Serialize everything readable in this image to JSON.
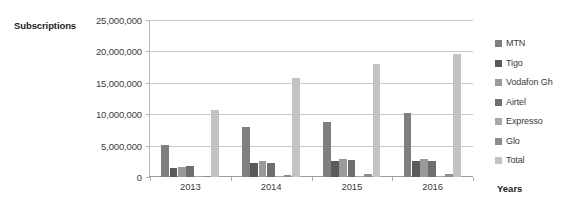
{
  "chart_data": {
    "type": "bar",
    "title": "",
    "xlabel": "Years",
    "ylabel": "Subscriptions",
    "categories": [
      "2013",
      "2014",
      "2015",
      "2016"
    ],
    "ylim": [
      0,
      25000000
    ],
    "yticks": [
      0,
      5000000,
      10000000,
      15000000,
      20000000,
      25000000
    ],
    "ytick_labels": [
      "0",
      "5,000,000",
      "10,000,000",
      "15,000,000",
      "20,000,000",
      "25,000,000"
    ],
    "grid": true,
    "legend_position": "right",
    "series": [
      {
        "name": "MTN",
        "color": "#7f7f7f",
        "values": [
          5100000,
          8000000,
          8700000,
          10200000
        ]
      },
      {
        "name": "Tigo",
        "color": "#5a5a5a",
        "values": [
          1400000,
          2200000,
          2600000,
          2500000
        ]
      },
      {
        "name": "Vodafon Gh",
        "color": "#9a9a9a",
        "values": [
          1600000,
          2500000,
          2900000,
          2900000
        ]
      },
      {
        "name": "Airtel",
        "color": "#6e6e6e",
        "values": [
          1700000,
          2300000,
          2700000,
          2600000
        ]
      },
      {
        "name": "Expresso",
        "color": "#a8a8a8",
        "values": [
          100000,
          120000,
          120000,
          110000
        ]
      },
      {
        "name": "Glo",
        "color": "#8c8c8c",
        "values": [
          150000,
          400000,
          420000,
          420000
        ]
      },
      {
        "name": "Total",
        "color": "#c3c3c3",
        "values": [
          10700000,
          15800000,
          18000000,
          19600000
        ]
      }
    ]
  }
}
